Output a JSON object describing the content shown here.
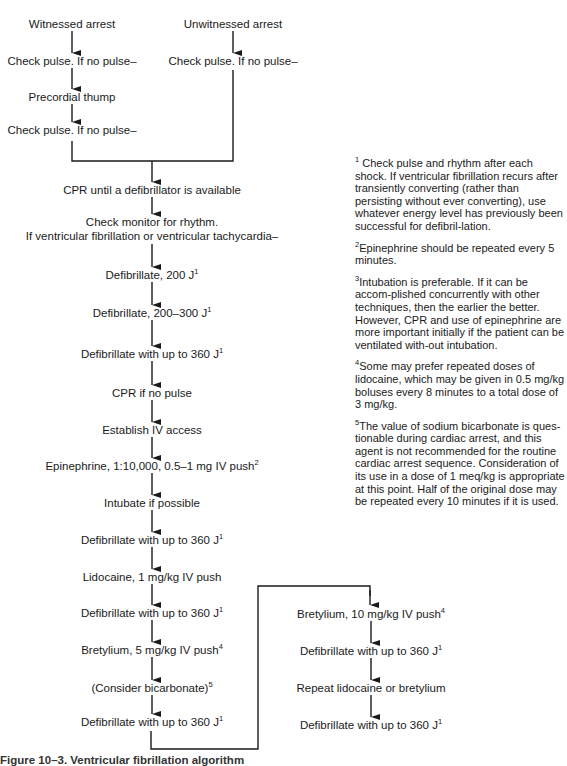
{
  "diagram": {
    "colors": {
      "ink": "#1a1a1a",
      "background": "#ffffff"
    },
    "nodes": [
      {
        "id": "witnessed",
        "text": "Witnessed arrest",
        "sup": "",
        "x": 72,
        "y": 24
      },
      {
        "id": "check1",
        "text": "Check pulse. If no pulse–",
        "sup": "",
        "x": 72,
        "y": 61
      },
      {
        "id": "thump",
        "text": "Precordial thump",
        "sup": "",
        "x": 72,
        "y": 97
      },
      {
        "id": "check2",
        "text": "Check pulse. If no pulse–",
        "sup": "",
        "x": 72,
        "y": 130
      },
      {
        "id": "unwitnessed",
        "text": "Unwitnessed arrest",
        "sup": "",
        "x": 233,
        "y": 24
      },
      {
        "id": "check3",
        "text": "Check pulse. If no pulse–",
        "sup": "",
        "x": 233,
        "y": 61
      },
      {
        "id": "cpr",
        "text": "CPR until a defibrillator is available",
        "sup": "",
        "x": 152,
        "y": 190
      },
      {
        "id": "monitor1",
        "text": "Check monitor for rhythm.",
        "sup": "",
        "x": 152,
        "y": 222
      },
      {
        "id": "monitor2",
        "text": "If ventricular fibrillation or ventricular tachycardia–",
        "sup": "",
        "x": 152,
        "y": 236
      },
      {
        "id": "defib200",
        "text": "Defibrillate, 200 J",
        "sup": "1",
        "x": 152,
        "y": 275
      },
      {
        "id": "defib300",
        "text": "Defibrillate, 200–300 J",
        "sup": "1",
        "x": 152,
        "y": 313
      },
      {
        "id": "defib360a",
        "text": "Defibrillate with up to 360 J",
        "sup": "1",
        "x": 152,
        "y": 354
      },
      {
        "id": "cprnopulse",
        "text": "CPR if no pulse",
        "sup": "",
        "x": 152,
        "y": 393
      },
      {
        "id": "iv",
        "text": "Establish IV access",
        "sup": "",
        "x": 152,
        "y": 430
      },
      {
        "id": "epi",
        "text": "Epinephrine, 1:10,000, 0.5–1 mg IV push",
        "sup": "2",
        "x": 152,
        "y": 466
      },
      {
        "id": "intubate",
        "text": "Intubate if possible",
        "sup": "",
        "x": 152,
        "y": 503
      },
      {
        "id": "defib360b",
        "text": "Defibrillate with up to 360 J",
        "sup": "1",
        "x": 152,
        "y": 540
      },
      {
        "id": "lido",
        "text": "Lidocaine, 1 mg/kg IV push",
        "sup": "",
        "x": 152,
        "y": 577
      },
      {
        "id": "defib360c",
        "text": "Defibrillate with up to 360 J",
        "sup": "1",
        "x": 152,
        "y": 613
      },
      {
        "id": "bret5",
        "text": "Bretylium, 5 mg/kg IV push",
        "sup": "4",
        "x": 152,
        "y": 650
      },
      {
        "id": "bicarb",
        "text": "(Consider bicarbonate)",
        "sup": "5",
        "x": 152,
        "y": 688
      },
      {
        "id": "defib360d",
        "text": "Defibrillate with up to 360 J",
        "sup": "1",
        "x": 152,
        "y": 722
      },
      {
        "id": "bret10",
        "text": "Bretylium, 10 mg/kg IV push",
        "sup": "4",
        "x": 371,
        "y": 614
      },
      {
        "id": "defib360e",
        "text": "Defibrillate with up to 360 J",
        "sup": "1",
        "x": 371,
        "y": 651
      },
      {
        "id": "repeat",
        "text": "Repeat lidocaine or bretylium",
        "sup": "",
        "x": 371,
        "y": 688
      },
      {
        "id": "defib360f",
        "text": "Defibrillate with up to 360 J",
        "sup": "1",
        "x": 371,
        "y": 725
      }
    ]
  },
  "footnotes": [
    {
      "num": "1",
      "text": " Check pulse and rhythm after each shock. If ventricular fibrillation recurs after transiently converting (rather than persisting without ever converting), use whatever energy level has previously been successful for defibril-lation."
    },
    {
      "num": "2",
      "text": "Epinephrine should be repeated every 5 minutes."
    },
    {
      "num": "3",
      "text": "Intubation is preferable. If it can be accom-plished concurrently with other techniques, then the earlier the better. However, CPR and use of epinephrine are more important initially if the patient can be ventilated with-out intubation."
    },
    {
      "num": "4",
      "text": "Some may prefer repeated doses of lidocaine, which may be given in 0.5 mg/kg boluses every 8 minutes to a total dose of 3 mg/kg."
    },
    {
      "num": "5",
      "text": "The value of sodium bicarbonate is ques-tionable during cardiac arrest, and this agent is not recommended for the routine cardiac arrest sequence. Consideration of its use in a dose of 1 meq/kg is appropriate at this point. Half of the original dose may be repeated every 10 minutes if it is used."
    }
  ],
  "caption": {
    "text": "Figure 10–3. Ventricular fibrillation algorithm"
  }
}
